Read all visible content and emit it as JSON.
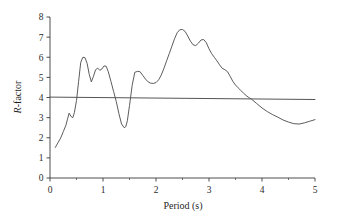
{
  "chart_data": {
    "type": "line",
    "title": "",
    "xlabel": "Period (s)",
    "ylabel": "R-factor",
    "ylabel_parts": {
      "italic": "R",
      "rest": "-factor"
    },
    "xlim": [
      0,
      5
    ],
    "ylim": [
      0,
      8
    ],
    "xticks": [
      0,
      1,
      2,
      3,
      4,
      5
    ],
    "xtick_labels": [
      "0",
      "1",
      "2",
      "3",
      "4",
      "5"
    ],
    "xminor_ticks": [
      0.5,
      1.5,
      2.5,
      3.5,
      4.5
    ],
    "yticks": [
      0,
      1,
      2,
      3,
      4,
      5,
      6,
      7,
      8
    ],
    "ytick_labels": [
      "0",
      "1",
      "2",
      "3",
      "4",
      "5",
      "6",
      "7",
      "8"
    ],
    "grid": false,
    "legend": null,
    "series": [
      {
        "name": "R-factor curve",
        "color": "#4a4a4a",
        "linewidth": 0.9,
        "x": [
          0.1,
          0.15,
          0.2,
          0.25,
          0.3,
          0.33,
          0.36,
          0.4,
          0.43,
          0.46,
          0.5,
          0.54,
          0.58,
          0.62,
          0.66,
          0.7,
          0.74,
          0.78,
          0.82,
          0.86,
          0.9,
          0.94,
          0.98,
          1.02,
          1.06,
          1.1,
          1.15,
          1.2,
          1.25,
          1.3,
          1.35,
          1.4,
          1.43,
          1.46,
          1.5,
          1.55,
          1.6,
          1.65,
          1.7,
          1.75,
          1.8,
          1.85,
          1.9,
          1.95,
          2.0,
          2.05,
          2.1,
          2.15,
          2.2,
          2.25,
          2.3,
          2.35,
          2.4,
          2.45,
          2.5,
          2.55,
          2.6,
          2.65,
          2.7,
          2.75,
          2.8,
          2.85,
          2.9,
          2.95,
          3.0,
          3.05,
          3.1,
          3.15,
          3.2,
          3.25,
          3.3,
          3.35,
          3.4,
          3.45,
          3.5,
          3.55,
          3.6,
          3.65,
          3.7,
          3.75,
          3.8,
          3.9,
          4.0,
          4.1,
          4.2,
          4.3,
          4.4,
          4.5,
          4.6,
          4.7,
          4.8,
          4.9,
          5.0
        ],
        "y": [
          1.52,
          1.75,
          1.98,
          2.3,
          2.62,
          2.92,
          3.22,
          3.05,
          3.0,
          3.25,
          3.85,
          4.8,
          5.75,
          6.0,
          5.98,
          5.7,
          5.15,
          4.78,
          5.05,
          5.38,
          5.46,
          5.35,
          5.42,
          5.57,
          5.55,
          5.28,
          4.8,
          4.3,
          3.8,
          3.2,
          2.68,
          2.5,
          2.55,
          2.85,
          3.6,
          4.6,
          5.25,
          5.3,
          5.28,
          5.1,
          4.92,
          4.78,
          4.71,
          4.7,
          4.74,
          4.88,
          5.12,
          5.45,
          5.82,
          6.18,
          6.55,
          6.92,
          7.22,
          7.37,
          7.38,
          7.28,
          7.05,
          6.8,
          6.62,
          6.58,
          6.7,
          6.86,
          6.88,
          6.72,
          6.42,
          6.18,
          6.0,
          5.82,
          5.62,
          5.45,
          5.38,
          5.28,
          5.05,
          4.8,
          4.62,
          4.48,
          4.35,
          4.22,
          4.1,
          4.0,
          3.92,
          3.7,
          3.48,
          3.3,
          3.15,
          3.02,
          2.88,
          2.78,
          2.7,
          2.68,
          2.74,
          2.82,
          2.9
        ]
      },
      {
        "name": "reference-line",
        "color": "#555555",
        "linewidth": 1.0,
        "x": [
          0.0,
          5.0
        ],
        "y": [
          4.02,
          3.9
        ]
      }
    ],
    "annotations": []
  },
  "axes": {
    "x_title": "Period (s)",
    "y_title_italic": "R",
    "y_title_rest": "-factor"
  },
  "colors": {
    "curve": "#4a4a4a",
    "reference": "#555555",
    "axis": "#3a3a3a",
    "background": "#ffffff",
    "text": "#1f1f1f"
  }
}
